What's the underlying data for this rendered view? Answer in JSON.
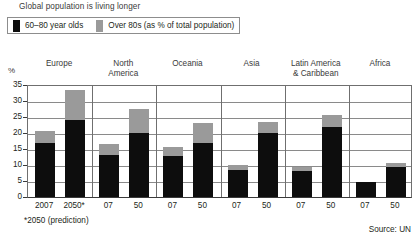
{
  "chart_data": {
    "type": "bar",
    "title": "Global population is living longer",
    "subtitle": "",
    "xlabel": "",
    "ylabel": "%",
    "ylim": [
      0,
      35
    ],
    "yticks": [
      0,
      5,
      10,
      15,
      20,
      25,
      30,
      35
    ],
    "grid": true,
    "stacked": true,
    "legend_position": "top-left",
    "legend": [
      {
        "name": "60–80 year olds",
        "color": "#0d0d0d"
      },
      {
        "name": "Over 80s (as % of total population)",
        "color": "#9a9a9a"
      }
    ],
    "panels": [
      {
        "region": "Europe",
        "categories": [
          "2007",
          "2050*"
        ],
        "series": [
          {
            "name": "60–80 year olds",
            "values": [
              16.8,
              24.2
            ]
          },
          {
            "name": "Over 80s",
            "values": [
              3.8,
              9.3
            ]
          }
        ],
        "totals": [
          20.6,
          33.5
        ]
      },
      {
        "region": "North America",
        "categories": [
          "07",
          "50"
        ],
        "series": [
          {
            "name": "60–80 year olds",
            "values": [
              13.0,
              20.0
            ]
          },
          {
            "name": "Over 80s",
            "values": [
              3.5,
              7.5
            ]
          }
        ],
        "totals": [
          16.5,
          27.5
        ]
      },
      {
        "region": "Oceania",
        "categories": [
          "07",
          "50"
        ],
        "series": [
          {
            "name": "60–80 year olds",
            "values": [
              12.8,
              17.0
            ]
          },
          {
            "name": "Over 80s",
            "values": [
              2.7,
              6.0
            ]
          }
        ],
        "totals": [
          15.5,
          23.0
        ]
      },
      {
        "region": "Asia",
        "categories": [
          "07",
          "50"
        ],
        "series": [
          {
            "name": "60–80 year olds",
            "values": [
              8.5,
              20.0
            ]
          },
          {
            "name": "Over 80s",
            "values": [
              1.5,
              3.5
            ]
          }
        ],
        "totals": [
          10.0,
          23.5
        ]
      },
      {
        "region": "Latin America & Caribbean",
        "categories": [
          "07",
          "50"
        ],
        "series": [
          {
            "name": "60–80 year olds",
            "values": [
              8.0,
              22.0
            ]
          },
          {
            "name": "Over 80s",
            "values": [
              1.5,
              3.5
            ]
          }
        ],
        "totals": [
          9.5,
          25.5
        ]
      },
      {
        "region": "Africa",
        "categories": [
          "07",
          "50"
        ],
        "series": [
          {
            "name": "60–80 year olds",
            "values": [
              4.6,
              9.5
            ]
          },
          {
            "name": "Over 80s",
            "values": [
              0.0,
              1.0
            ]
          }
        ],
        "totals": [
          4.6,
          10.5
        ]
      }
    ],
    "footnote": "*2050 (prediction)",
    "source": "Source: UN"
  },
  "title": "Global population is living longer",
  "legend": {
    "item1_label": "60–80 year olds",
    "item2_label": "Over 80s (as % of total population)"
  },
  "axis": {
    "y_unit": "%",
    "y_ticks": [
      "35",
      "30",
      "25",
      "20",
      "15",
      "10",
      "5",
      "0"
    ]
  },
  "panels": [
    {
      "title_line1": "Europe",
      "title_line2": "",
      "tick1": "2007",
      "tick2": "2050*"
    },
    {
      "title_line1": "North",
      "title_line2": "America",
      "tick1": "07",
      "tick2": "50"
    },
    {
      "title_line1": "Oceania",
      "title_line2": "",
      "tick1": "07",
      "tick2": "50"
    },
    {
      "title_line1": "Asia",
      "title_line2": "",
      "tick1": "07",
      "tick2": "50"
    },
    {
      "title_line1": "Latin America",
      "title_line2": "& Caribbean",
      "tick1": "07",
      "tick2": "50"
    },
    {
      "title_line1": "Africa",
      "title_line2": "",
      "tick1": "07",
      "tick2": "50"
    }
  ],
  "footnote": "*2050 (prediction)",
  "source": "Source: UN",
  "colors": {
    "series_60to80": "#0d0d0d",
    "series_over80": "#9a9a9a",
    "grid": "#8a8a8a",
    "frame": "#6f6f6f"
  }
}
